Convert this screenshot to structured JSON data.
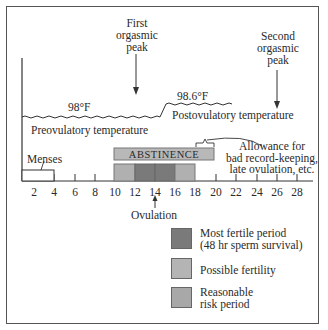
{
  "annotations": {
    "first_peak": [
      "First",
      "orgasmic",
      "peak"
    ],
    "second_peak": [
      "Second",
      "orgasmic",
      "peak"
    ],
    "temp_low": "98°F",
    "temp_high": "98.6°F",
    "preovulatory": "Preovulatory temperature",
    "postovulatory": "Postovulatory temperature",
    "abstinence": "ABSTINENCE",
    "allowance": [
      "Allowance for",
      "bad record-keeping,",
      "late ovulation, etc."
    ],
    "menses": "Menses",
    "ovulation": "Ovulation"
  },
  "axis": {
    "days": [
      "2",
      "4",
      "6",
      "8",
      "10",
      "12",
      "14",
      "16",
      "18",
      "20",
      "22",
      "24",
      "26",
      "28"
    ]
  },
  "periods": [
    {
      "name": "reasonable-risk",
      "from": 10,
      "to": 12
    },
    {
      "name": "most-fertile",
      "from": 12,
      "to": 16
    },
    {
      "name": "reasonable-risk",
      "from": 16,
      "to": 18
    }
  ],
  "legend": {
    "items": [
      {
        "label_lines": [
          "Most fertile period",
          "(48 hr sperm survival)"
        ],
        "color": "#7a7a7a"
      },
      {
        "label_lines": [
          "Possible fertility"
        ],
        "color": "#b4b4b4"
      },
      {
        "label_lines": [
          "Reasonable",
          "risk period"
        ],
        "color": "#a8a8a8"
      }
    ]
  },
  "colors": {
    "dark": "#7a7a7a",
    "light": "#b0b0b0",
    "abstinence": "#b8b8b8",
    "line": "#333333"
  }
}
